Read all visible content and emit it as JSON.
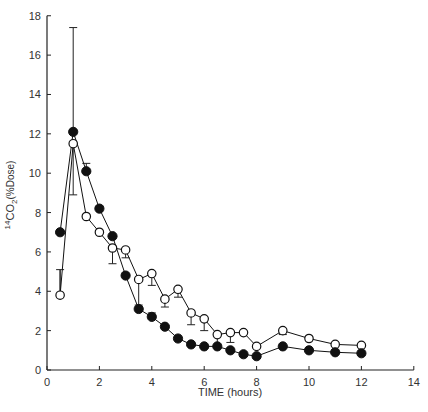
{
  "chart_data": {
    "type": "line",
    "title": "",
    "xlabel": "TIME (hours)",
    "ylabel": "14CO2(%Dose)",
    "ylabel_parts": {
      "sup": "14",
      "main": "CO",
      "sub": "2",
      "rest": "(%Dose)"
    },
    "xlim": [
      0,
      14
    ],
    "ylim": [
      0,
      18
    ],
    "xticks": [
      0,
      2,
      4,
      6,
      8,
      10,
      12,
      14
    ],
    "yticks": [
      0,
      2,
      4,
      6,
      8,
      10,
      12,
      14,
      16,
      18
    ],
    "grid": false,
    "legend": null,
    "series": [
      {
        "name": "filled circles",
        "marker": "filled-circle",
        "color": "#111111",
        "x": [
          0.5,
          1,
          1.5,
          2,
          2.5,
          3,
          3.5,
          4,
          4.5,
          5,
          5.5,
          6,
          6.5,
          7,
          7.5,
          8,
          9,
          10,
          11,
          12
        ],
        "values": [
          7.0,
          12.1,
          10.1,
          8.2,
          6.8,
          4.8,
          3.1,
          2.7,
          2.2,
          1.6,
          1.3,
          1.2,
          1.2,
          1.0,
          0.8,
          0.7,
          1.2,
          1.0,
          0.9,
          0.85
        ],
        "error_upper": [
          0,
          17.4,
          10.5,
          8.3,
          0,
          0,
          0,
          2.9,
          0,
          0,
          0,
          0,
          0,
          0,
          0,
          0,
          0,
          0,
          0,
          0
        ]
      },
      {
        "name": "open circles",
        "marker": "open-circle",
        "color": "#111111",
        "x": [
          0.5,
          1,
          1.5,
          2,
          2.5,
          3,
          3.5,
          4,
          4.5,
          5,
          5.5,
          6,
          6.5,
          7,
          7.5,
          8,
          9,
          10,
          11,
          12
        ],
        "values": [
          3.8,
          11.5,
          7.8,
          7.0,
          6.2,
          6.1,
          4.6,
          4.9,
          3.6,
          4.1,
          2.9,
          2.6,
          1.8,
          1.9,
          1.9,
          1.2,
          2.0,
          1.6,
          1.3,
          1.25
        ],
        "error_lower": [
          5.1,
          8.9,
          8.7,
          7.0,
          5.4,
          5.7,
          3.3,
          4.3,
          3.2,
          3.7,
          2.3,
          2.0,
          1.3,
          1.4,
          1.9,
          1.2,
          1.8,
          1.6,
          1.3,
          1.25
        ]
      }
    ]
  }
}
